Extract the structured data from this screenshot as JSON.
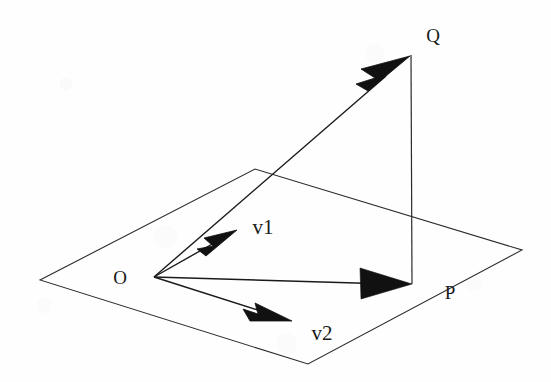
{
  "figure": {
    "background_color": "#fefefe",
    "stroke_color": "#1a1a1a",
    "fill_color": "#111111",
    "width": 551,
    "height": 382
  },
  "labels": {
    "origin": "O",
    "point_p": "P",
    "point_q": "Q",
    "vector1": "v1",
    "vector2": "v2"
  },
  "label_positions": {
    "origin": {
      "x": 120,
      "y": 277
    },
    "point_p": {
      "x": 450,
      "y": 292
    },
    "point_q": {
      "x": 433,
      "y": 35
    },
    "vector1": {
      "x": 263,
      "y": 227
    },
    "vector2": {
      "x": 322,
      "y": 333
    }
  },
  "geometry": {
    "plane": {
      "name": "plane-parallelogram",
      "corners": [
        {
          "name": "left",
          "x": 40,
          "y": 280
        },
        {
          "name": "top",
          "x": 255,
          "y": 169
        },
        {
          "name": "right",
          "x": 522,
          "y": 250
        },
        {
          "name": "bottom",
          "x": 308,
          "y": 364
        }
      ]
    },
    "origin_point": {
      "x": 154,
      "y": 277
    },
    "arrows": [
      {
        "name": "vector-op",
        "from": {
          "x": 154,
          "y": 277
        },
        "to": {
          "x": 412,
          "y": 284
        },
        "head_style": "solid-wide"
      },
      {
        "name": "vector-oq",
        "from": {
          "x": 154,
          "y": 277
        },
        "to": {
          "x": 410,
          "y": 56
        },
        "head_style": "solid-barbed"
      },
      {
        "name": "vector-v1",
        "from": {
          "x": 154,
          "y": 277
        },
        "to": {
          "x": 236,
          "y": 231
        },
        "head_style": "solid-barbed"
      },
      {
        "name": "vector-v2",
        "from": {
          "x": 154,
          "y": 277
        },
        "to": {
          "x": 291,
          "y": 321
        },
        "head_style": "solid-barbed"
      }
    ],
    "segments": [
      {
        "name": "segment-pq-vertical",
        "from": {
          "x": 412,
          "y": 284
        },
        "to": {
          "x": 411,
          "y": 55
        }
      }
    ]
  }
}
